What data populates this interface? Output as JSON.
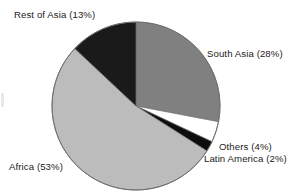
{
  "chart_data": {
    "type": "pie",
    "title": "",
    "categories": [
      "South Asia",
      "Others",
      "Latin America",
      "Africa",
      "Rest of Asia"
    ],
    "values": [
      28,
      4,
      2,
      53,
      13
    ],
    "unit": "%",
    "start_angle_deg": 0,
    "direction": "clockwise",
    "legend": "none",
    "grid": false,
    "slices": [
      {
        "label": "South Asia",
        "value": 28,
        "value_text": "28%",
        "color": "#808080",
        "label_text": "South Asia (28%)"
      },
      {
        "label": "Others",
        "value": 4,
        "value_text": "4%",
        "color": "#ffffff",
        "label_text": "Others (4%)"
      },
      {
        "label": "Latin America",
        "value": 2,
        "value_text": "2%",
        "color": "#0d0d0d",
        "label_text": "Latin America (2%)"
      },
      {
        "label": "Africa",
        "value": 53,
        "value_text": "53%",
        "color": "#bcbcbc",
        "label_text": "Africa (53%)"
      },
      {
        "label": "Rest of Asia",
        "value": 13,
        "value_text": "13%",
        "color": "#1a1a1a",
        "label_text": "Rest of Asia (13%)"
      }
    ]
  },
  "labels": {
    "rest_of_asia": "Rest of Asia (13%)",
    "south_asia": "South Asia (28%)",
    "others": "Others (4%)",
    "latin_america": "Latin America (2%)",
    "africa": "Africa (53%)"
  },
  "colors": {
    "background": "#ffffff",
    "text": "#1b1b1b",
    "outline": "#6e6e6e",
    "south_asia": "#808080",
    "others": "#ffffff",
    "latin_america": "#0d0d0d",
    "africa": "#bcbcbc",
    "rest_of_asia": "#1a1a1a"
  },
  "geometry": {
    "center_x": 136,
    "center_y": 106,
    "radius": 84
  }
}
